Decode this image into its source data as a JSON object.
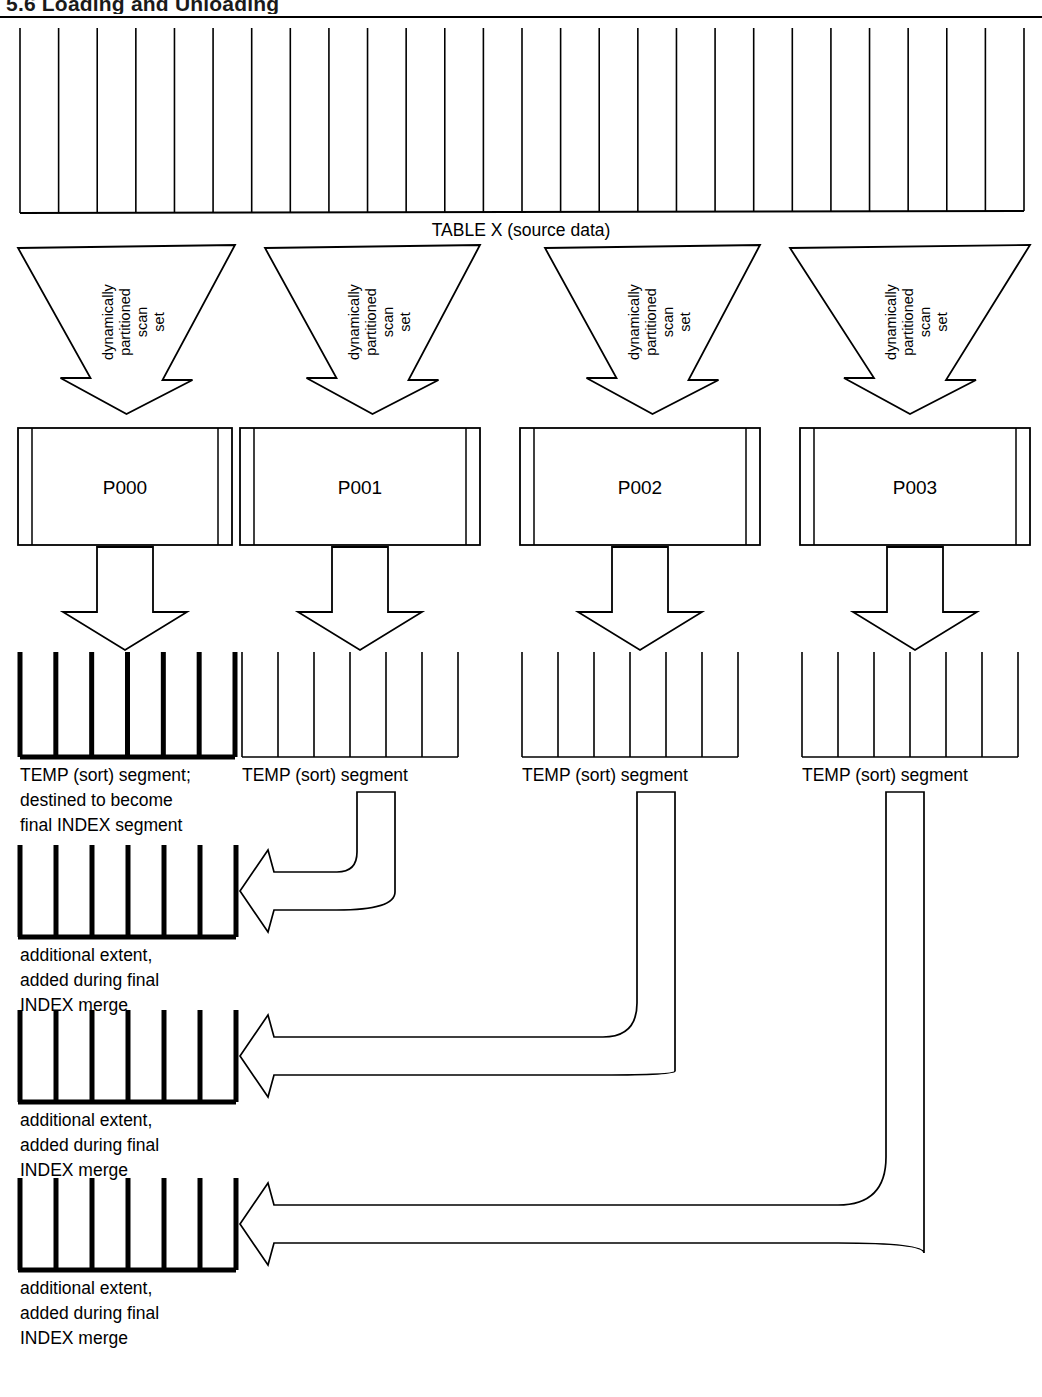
{
  "page": {
    "header_title": "5.6  Loading and Unloading",
    "background": "#ffffff",
    "ink": "#000000"
  },
  "source_table": {
    "label": "TABLE X (source data)",
    "block_count": 26,
    "name": "source-data-block"
  },
  "funnels": [
    {
      "id": "funnel-0",
      "lines": [
        "dynamically",
        "partitioned",
        "scan",
        "set"
      ]
    },
    {
      "id": "funnel-1",
      "lines": [
        "dynamically",
        "partitioned",
        "scan",
        "set"
      ]
    },
    {
      "id": "funnel-2",
      "lines": [
        "dynamically",
        "partitioned",
        "scan",
        "set"
      ]
    },
    {
      "id": "funnel-3",
      "lines": [
        "dynamically",
        "partitioned",
        "scan",
        "set"
      ]
    }
  ],
  "processes": [
    {
      "id": "process-p000",
      "label": "P000"
    },
    {
      "id": "process-p001",
      "label": "P001"
    },
    {
      "id": "process-p002",
      "label": "P002"
    },
    {
      "id": "process-p003",
      "label": "P003"
    }
  ],
  "temp_segments": [
    {
      "id": "temp-segment-0",
      "bold": true,
      "divider_count": 7,
      "label_lines": [
        "TEMP (sort) segment;",
        "destined to become",
        "final INDEX segment"
      ]
    },
    {
      "id": "temp-segment-1",
      "bold": false,
      "divider_count": 7,
      "label_lines": [
        "TEMP (sort) segment"
      ]
    },
    {
      "id": "temp-segment-2",
      "bold": false,
      "divider_count": 7,
      "label_lines": [
        "TEMP (sort) segment"
      ]
    },
    {
      "id": "temp-segment-3",
      "bold": false,
      "divider_count": 7,
      "label_lines": [
        "TEMP (sort) segment"
      ]
    }
  ],
  "extents": [
    {
      "id": "extent-0",
      "divider_count": 7,
      "label_lines": [
        "additional extent,",
        "added during final",
        "INDEX merge"
      ]
    },
    {
      "id": "extent-1",
      "divider_count": 7,
      "label_lines": [
        "additional extent,",
        "added during final",
        "INDEX merge"
      ]
    },
    {
      "id": "extent-2",
      "divider_count": 7,
      "label_lines": [
        "additional extent,",
        "added during final",
        "INDEX merge"
      ]
    }
  ],
  "connectors": {
    "scan_arrows": 4,
    "merge_arrows": 4,
    "curved_arrows": [
      {
        "id": "curve-p001-to-extent-0",
        "from": "temp-segment-1",
        "to": "extent-0"
      },
      {
        "id": "curve-p002-to-extent-1",
        "from": "temp-segment-2",
        "to": "extent-1"
      },
      {
        "id": "curve-p003-to-extent-2",
        "from": "temp-segment-3",
        "to": "extent-2"
      }
    ]
  }
}
